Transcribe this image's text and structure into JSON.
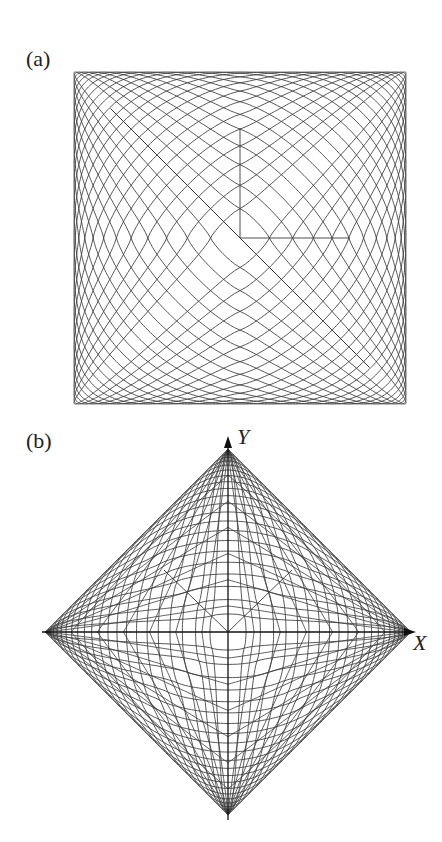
{
  "panels": [
    {
      "label": "(a)",
      "center": [
        240,
        238
      ],
      "half_extent": 166,
      "curve_count": 24
    },
    {
      "label": "(b)",
      "center": [
        228,
        632
      ],
      "half_extent": 183,
      "curve_count": 24,
      "axes": {
        "x_label": "X",
        "y_label": "Y"
      }
    }
  ],
  "colors": {
    "line": "#3a3a3a",
    "axis": "#111111",
    "background": "#ffffff"
  }
}
